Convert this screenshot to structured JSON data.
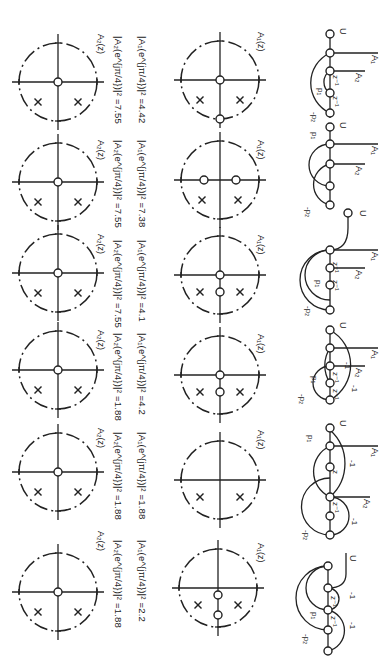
{
  "figure": {
    "orientation": "rotated 90 degrees clockwise",
    "row_count": 6,
    "rows": [
      {
        "index": 1,
        "flow_graph": {
          "input": "U",
          "outputs": [
            "A1",
            "A2"
          ],
          "delays": [
            "z-1",
            "z-1"
          ],
          "coefficients": [
            "p1",
            "-p2"
          ]
        },
        "a1_plot": {
          "label": "A1(z)",
          "zeros": "origin and unit circle",
          "poles": 2
        },
        "a2_plot": {
          "label": "A2(z)",
          "zeros": "origin",
          "poles": 2
        },
        "a1_mag_label": "|A1(e^jπ/4)|² = 4.42",
        "a2_mag_label": "|A2(e^jπ/4)|² = 7.55"
      },
      {
        "index": 2,
        "flow_graph": {
          "input": "U",
          "outputs": [
            "A1",
            "A2"
          ],
          "delays": [],
          "coefficients": [
            "p1",
            "-p2"
          ]
        },
        "a1_plot": {
          "label": "A1(z)",
          "zeros": "two on real axis",
          "poles": 2
        },
        "a2_plot": {
          "label": "A2(z)",
          "zeros": "origin",
          "poles": 2
        },
        "a1_mag_label": "|A1(e^jπ/4)|² = 7.38",
        "a2_mag_label": "|A2(e^jπ/4)|² = 7.55"
      },
      {
        "index": 3,
        "flow_graph": {
          "input": "U",
          "outputs": [
            "A1",
            "A2"
          ],
          "delays": [
            "z-1",
            "z-1"
          ],
          "coefficients": [
            "p1",
            "-p2"
          ]
        },
        "a1_plot": {
          "label": "A1(z)",
          "zeros": "origin and on imaginary axis",
          "poles": 2
        },
        "a2_plot": {
          "label": "A2(z)",
          "zeros": "origin",
          "poles": 2
        },
        "a1_mag_label": "|A1(e^jπ/4)|² = 4.1",
        "a2_mag_label": "|A2(e^jπ/4)|² = 7.55"
      },
      {
        "index": 4,
        "flow_graph": {
          "input": "U",
          "outputs": [
            "A1",
            "A2"
          ],
          "delays": [
            "z-1",
            "z-1"
          ],
          "coefficients": [
            "p1",
            "-p2",
            "-1",
            "-1"
          ]
        },
        "a1_plot": {
          "label": "A1(z)",
          "zeros": "origin and on imaginary axis",
          "poles": 2
        },
        "a2_plot": {
          "label": "A2(z)",
          "zeros": "origin",
          "poles": 2
        },
        "a1_mag_label": "|A1(e^jπ/4)|² = 4.2",
        "a2_mag_label": "|A2(e^jπ/4)|² = 1.88"
      },
      {
        "index": 5,
        "flow_graph": {
          "input": "U",
          "outputs": [
            "A1",
            "A2"
          ],
          "delays": [
            "z-1",
            "z-1"
          ],
          "coefficients": [
            "p1",
            "-p2",
            "-1",
            "-1"
          ]
        },
        "a1_plot": {
          "label": "A1(z)",
          "zeros": "none",
          "poles": 2
        },
        "a2_plot": {
          "label": "A2(z)",
          "zeros": "origin",
          "poles": 2
        },
        "a1_mag_label": "|A1(e^jπ/4)|² = 1.88",
        "a2_mag_label": "|A2(e^jπ/4)|² = 1.88"
      },
      {
        "index": 6,
        "flow_graph": {
          "input": "U",
          "outputs": [],
          "delays": [
            "z-1",
            "z-1"
          ],
          "coefficients": [
            "p1",
            "-p2",
            "-1",
            "-1"
          ]
        },
        "a1_plot": {
          "label": "A1(z)",
          "zeros": "two on imaginary axis",
          "poles": 2
        },
        "a2_plot": {
          "label": "A2(z)",
          "zeros": "origin",
          "poles": 2
        },
        "a1_mag_label": "|A1(e^jπ/4)|² = 2.2",
        "a2_mag_label": "|A2(e^jπ/4)|² = 1.88"
      }
    ]
  },
  "labels": {
    "U": "U",
    "A1": "A",
    "A1_sub": "1",
    "A2": "A",
    "A2_sub": "2",
    "z": "z",
    "neg1": "-1",
    "p1": "p",
    "p1_sub": "1",
    "p2": "-p",
    "p2_sub": "2",
    "A1z": "A₁(z)",
    "A2z": "A₂(z)"
  },
  "magnitudes": {
    "r1": {
      "a1": "|A₁(e^{jπ/4})|² =4.42",
      "a2": "|A₂(e^{jπ/4})|² =7.55"
    },
    "r2": {
      "a1": "|A₁(e^{jπ/4})|² =7.38",
      "a2": "|A₂(e^{jπ/4})|² =7.55"
    },
    "r3": {
      "a1": "|A₁(e^{jπ/4})|² =4.1",
      "a2": "|A₂(e^{jπ/4})|² =7.55"
    },
    "r4": {
      "a1": "|A₁(e^{jπ/4})|² =4.2",
      "a2": "|A₂(e^{jπ/4})|² =1.88"
    },
    "r5": {
      "a1": "|A₁(e^{jπ/4})|² =1.88",
      "a2": "|A₂(e^{jπ/4})|² =1.88"
    },
    "r6": {
      "a1": "|A₁(e^{jπ/4})|² =2.2",
      "a2": "|A₂(e^{jπ/4})|² =1.88"
    }
  }
}
